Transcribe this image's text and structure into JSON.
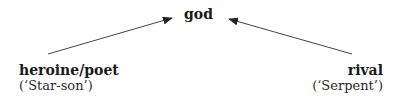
{
  "diagram": {
    "top_node": {
      "label": "god"
    },
    "left_node": {
      "label": "heroine/poet",
      "sublabel": "(‘Star-son’)"
    },
    "right_node": {
      "label": "rival",
      "sublabel": "(‘Serpent’)"
    },
    "edges": [
      {
        "from": "heroine/poet",
        "to": "god"
      },
      {
        "from": "rival",
        "to": "god"
      }
    ],
    "colors": {
      "arrow": "#333333",
      "text": "#1a1a1a"
    }
  }
}
